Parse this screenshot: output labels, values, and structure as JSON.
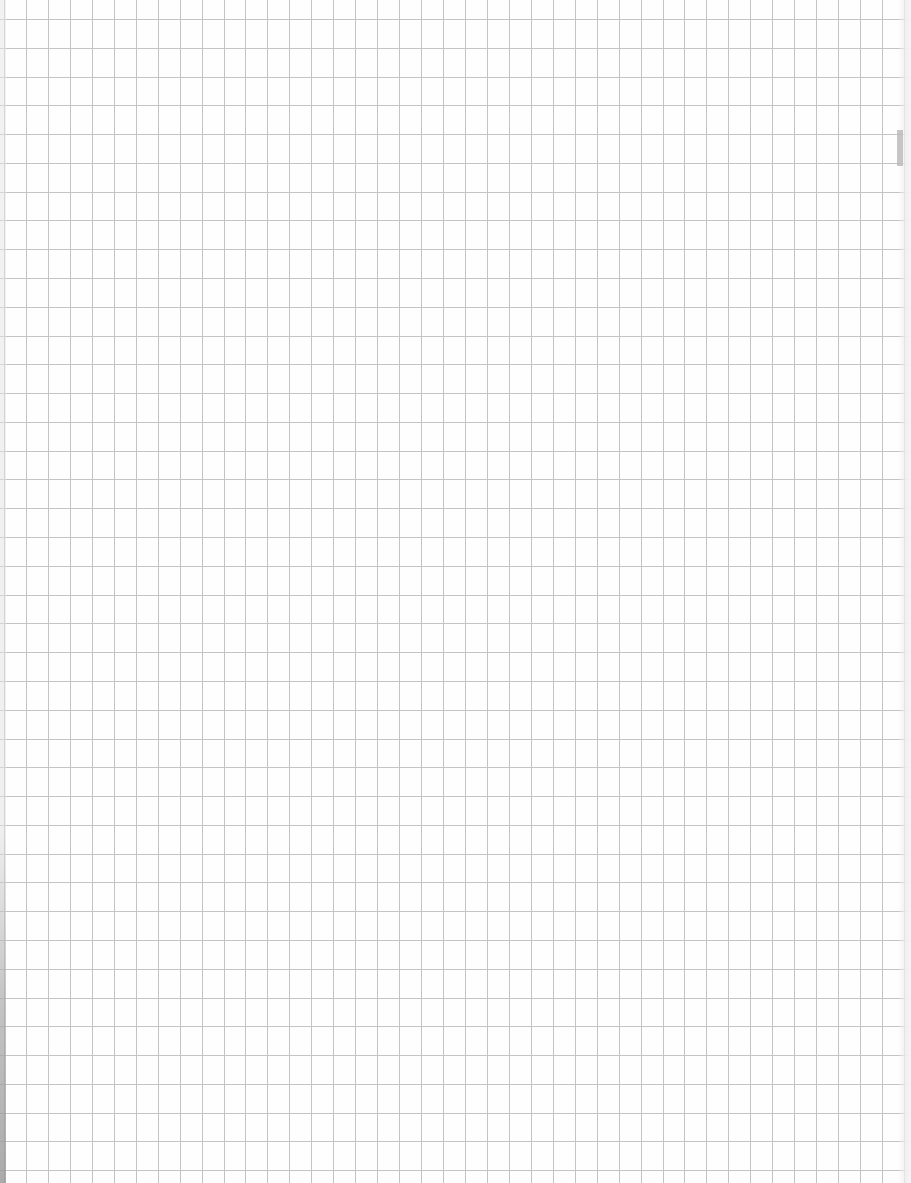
{
  "page": {
    "type": "graph-paper",
    "width": 911,
    "height": 1183
  },
  "grid": {
    "line_color": "#c4c4c4",
    "background_color": "#fefefe",
    "vertical": {
      "first_offset": 4,
      "spacing": 21.95,
      "count": 42
    },
    "horizontal": {
      "first_offset": 19,
      "spacing": 28.78,
      "count": 41
    }
  },
  "artifacts": {
    "right_edge_mark": {
      "x": 897,
      "y": 130,
      "width": 6,
      "height": 36,
      "color": "#b8b8b8"
    }
  }
}
